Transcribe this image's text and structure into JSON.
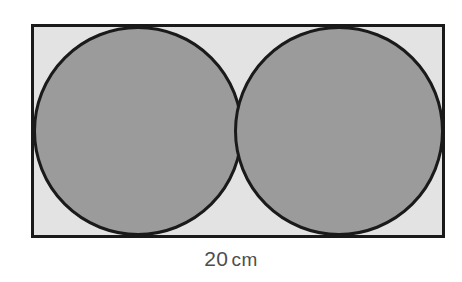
{
  "figure": {
    "background_color": "#ffffff",
    "rectangle": {
      "name": "outer-rectangle",
      "x": 31,
      "y": 24,
      "width": 414,
      "height": 214,
      "fill_color": "#e3e3e3",
      "stroke_color": "#1a1a1a",
      "stroke_width": 3
    },
    "circles": [
      {
        "name": "left-circle",
        "cx": 138,
        "cy": 131,
        "r": 105,
        "fill_color": "#9b9b9b",
        "stroke_color": "#1a1a1a",
        "stroke_width": 3
      },
      {
        "name": "right-circle",
        "cx": 339,
        "cy": 131,
        "r": 105,
        "fill_color": "#9b9b9b",
        "stroke_color": "#1a1a1a",
        "stroke_width": 3
      }
    ],
    "dimension_label": {
      "value": "20",
      "unit": "cm",
      "full_text": "20 cm",
      "color": "#4d4d4d",
      "position": "below-rectangle"
    }
  },
  "chart_data": {
    "type": "diagram",
    "shapes": [
      {
        "shape": "rectangle",
        "label": "outer rectangle",
        "width_cm": 20,
        "height_cm": 10,
        "fill": "#e3e3e3",
        "stroke": "#1a1a1a"
      },
      {
        "shape": "circle",
        "label": "left circle",
        "diameter_cm": 10,
        "radius_cm": 5,
        "center_cm": [
          5,
          5
        ],
        "fill": "#9b9b9b",
        "stroke": "#1a1a1a"
      },
      {
        "shape": "circle",
        "label": "right circle",
        "diameter_cm": 10,
        "radius_cm": 5,
        "center_cm": [
          15,
          5
        ],
        "fill": "#9b9b9b",
        "stroke": "#1a1a1a"
      }
    ],
    "annotations": [
      {
        "text": "20 cm",
        "refers_to": "rectangle width",
        "placement": "bottom-center"
      }
    ]
  }
}
